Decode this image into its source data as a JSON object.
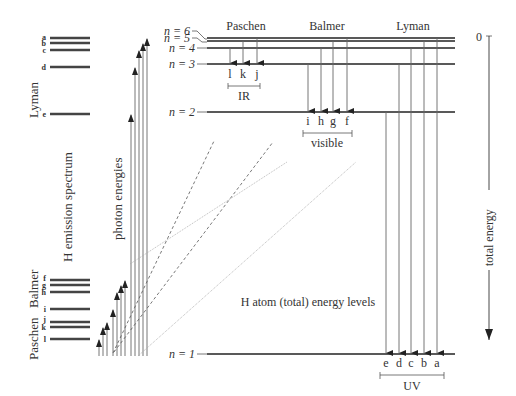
{
  "figure": {
    "left_panel": {
      "title": "H emission spectrum",
      "series_labels": {
        "lyman": "Lyman",
        "balmer": "Balmer",
        "paschen": "Paschen"
      },
      "lines": [
        {
          "label": "a",
          "y": 38
        },
        {
          "label": "b",
          "y": 43
        },
        {
          "label": "c",
          "y": 50
        },
        {
          "label": "d",
          "y": 67
        },
        {
          "label": "e",
          "y": 114
        },
        {
          "label": "f",
          "y": 280
        },
        {
          "label": "g",
          "y": 285
        },
        {
          "label": "h",
          "y": 292
        },
        {
          "label": "i",
          "y": 309
        },
        {
          "label": "j",
          "y": 322
        },
        {
          "label": "k",
          "y": 327
        },
        {
          "label": "l",
          "y": 339
        }
      ]
    },
    "middle_panel": {
      "title": "photon energies"
    },
    "right_panel": {
      "title": "H atom (total) energy levels",
      "levels": [
        {
          "label": "n = 6",
          "y": 38
        },
        {
          "label": "n = 5",
          "y": 41
        },
        {
          "label": "n = 4",
          "y": 48
        },
        {
          "label": "n = 3",
          "y": 64
        },
        {
          "label": "n = 2",
          "y": 112
        },
        {
          "label": "n = 1",
          "y": 354
        }
      ],
      "series": [
        {
          "name": "Paschen",
          "band": "IR",
          "transitions": [
            "l",
            "k",
            "j"
          ]
        },
        {
          "name": "Balmer",
          "band": "visible",
          "transitions": [
            "i",
            "h",
            "g",
            "f"
          ]
        },
        {
          "name": "Lyman",
          "band": "UV",
          "transitions": [
            "e",
            "d",
            "c",
            "b",
            "a"
          ]
        }
      ],
      "axis": {
        "label": "total energy",
        "zero": "0"
      }
    }
  }
}
